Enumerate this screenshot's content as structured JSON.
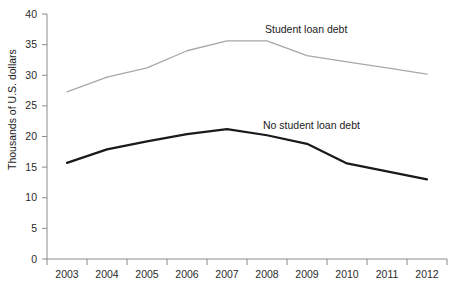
{
  "chart_data": {
    "type": "line",
    "title": "",
    "xlabel": "",
    "ylabel": "Thousands of U.S. dollars",
    "categories": [
      "2003",
      "2004",
      "2005",
      "2006",
      "2007",
      "2008",
      "2009",
      "2010",
      "2011",
      "2012"
    ],
    "x": [
      2003,
      2004,
      2005,
      2006,
      2007,
      2008,
      2009,
      2010,
      2011,
      2012
    ],
    "series": [
      {
        "name": "Student loan debt",
        "color": "#a8a8a8",
        "values": [
          27.3,
          29.7,
          31.2,
          34.0,
          35.6,
          35.6,
          33.2,
          32.2,
          31.2,
          30.2
        ]
      },
      {
        "name": "No student loan debt",
        "color": "#1a1a1a",
        "values": [
          15.7,
          17.9,
          19.2,
          20.4,
          21.2,
          20.2,
          18.8,
          15.6,
          14.3,
          13.0
        ]
      }
    ],
    "ylim": [
      0,
      40
    ],
    "yticks": [
      0,
      5,
      10,
      15,
      20,
      25,
      30,
      35,
      40
    ],
    "ytick_labels": [
      "0",
      "5",
      "10",
      "15",
      "20",
      "25",
      "30",
      "35",
      "40"
    ],
    "grid": false,
    "legend_position": "inline-annotations",
    "annotations": [
      {
        "text": "Student loan debt",
        "x_px": 265,
        "y_px": 33
      },
      {
        "text": "No student loan debt",
        "x_px": 263,
        "y_px": 129
      }
    ]
  },
  "axes": {
    "y_title": "Thousands of U.S. dollars",
    "y_labels": [
      "40",
      "35",
      "30",
      "25",
      "20",
      "15",
      "10",
      "5",
      "0"
    ],
    "x_labels": [
      "2003",
      "2004",
      "2005",
      "2006",
      "2007",
      "2008",
      "2009",
      "2010",
      "2011",
      "2012"
    ]
  }
}
